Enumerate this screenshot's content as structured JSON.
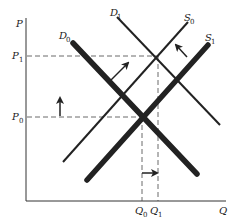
{
  "diagram": {
    "type": "supply-demand-shift",
    "axes": {
      "y_label": "P",
      "x_label": "Q"
    },
    "price_levels": [
      {
        "label": "P",
        "sub": "1",
        "name": "P1"
      },
      {
        "label": "P",
        "sub": "0",
        "name": "P0"
      }
    ],
    "quantity_levels": [
      {
        "label": "Q",
        "sub": "0",
        "name": "Q0"
      },
      {
        "label": "Q",
        "sub": "1",
        "name": "Q1"
      }
    ],
    "curves": [
      {
        "label": "D",
        "sub": "0",
        "name": "D0",
        "kind": "demand",
        "weight": "thick"
      },
      {
        "label": "D",
        "sub": "1",
        "name": "D1",
        "kind": "demand",
        "weight": "thin"
      },
      {
        "label": "S",
        "sub": "0",
        "name": "S0",
        "kind": "supply",
        "weight": "thin"
      },
      {
        "label": "S",
        "sub": "1",
        "name": "S1",
        "kind": "supply",
        "weight": "thick"
      }
    ],
    "shifts": [
      {
        "name": "demand-shift-arrow",
        "direction": "up-right"
      },
      {
        "name": "supply-shift-arrow",
        "direction": "up-left"
      },
      {
        "name": "price-increase-arrow",
        "direction": "up"
      },
      {
        "name": "quantity-increase-arrow",
        "direction": "right"
      }
    ],
    "colors": {
      "line": "#222222",
      "background": "#ffffff"
    }
  }
}
